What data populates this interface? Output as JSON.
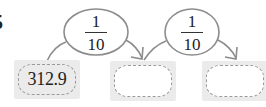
{
  "problem": {
    "number": "5"
  },
  "operators": [
    {
      "numerator": "1",
      "denominator": "10"
    },
    {
      "numerator": "1",
      "denominator": "10"
    }
  ],
  "boxes": [
    {
      "value": "312.9",
      "filled": true
    },
    {
      "value": "",
      "filled": false
    },
    {
      "value": "",
      "filled": false
    }
  ],
  "colors": {
    "box_background": "#ebebeb",
    "dashed_border": "#9a9a9a",
    "line": "#8c8c8c",
    "text": "#222222"
  }
}
